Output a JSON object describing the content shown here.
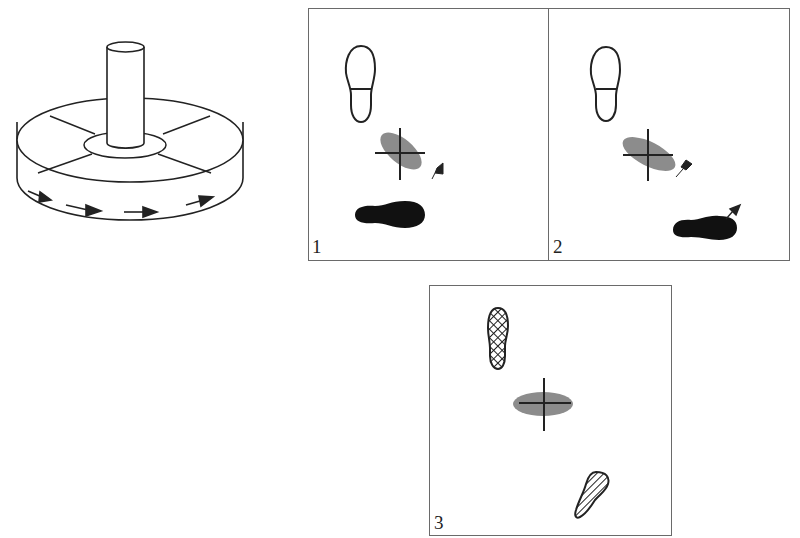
{
  "figure": {
    "apparatus": {
      "description": "Rotating platform with central pole; arrows indicate rotation direction",
      "arrow_count": 4
    },
    "panels": [
      {
        "label": "1",
        "left_foot": "outline",
        "right_foot": "solid-black",
        "right_foot_arrow": false,
        "center_marker": "crosshair-over-tilted-ellipse"
      },
      {
        "label": "2",
        "left_foot": "outline",
        "right_foot": "solid-black",
        "right_foot_arrow": true,
        "center_marker": "crosshair-over-tilted-ellipse"
      },
      {
        "label": "3",
        "left_foot": "crosshatched",
        "right_foot": "striped",
        "right_foot_arrow": false,
        "center_marker": "crosshair-over-horizontal-ellipse"
      }
    ],
    "colors": {
      "line": "#222222",
      "ellipse": "#8c8c8c",
      "border": "#6a6a6a"
    }
  }
}
